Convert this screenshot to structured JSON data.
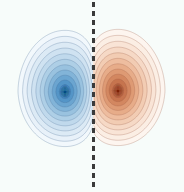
{
  "figure": {
    "width": 184,
    "height": 192,
    "background_color": "#f7fcfa",
    "title": "",
    "border": "none"
  },
  "divider": {
    "name": "nodal-plane-dashed-line",
    "orientation": "vertical",
    "x": 93,
    "y_start": 2,
    "y_end": 190,
    "color": "#3a3a3a",
    "line_width": 3,
    "dash_on": 5,
    "dash_off": 4,
    "style": "dashed"
  },
  "chart_data": {
    "type": "heatmap",
    "subtype": "filled-contour",
    "title": "",
    "subtitle": "",
    "xlabel": "",
    "ylabel": "",
    "xlim": [
      0,
      184
    ],
    "ylim": [
      0,
      192
    ],
    "grid": false,
    "axes_visible": false,
    "tick_labels_x": [],
    "tick_labels_y": [],
    "legend": {
      "visible": false,
      "position": "none",
      "entries": []
    },
    "annotations": [
      {
        "name": "nodal-plane",
        "type": "vertical-dashed-line",
        "x": 93,
        "label": ""
      }
    ],
    "colormap": "RdBu_r",
    "n_levels": 12,
    "levels": [
      -1.0,
      -0.85,
      -0.7,
      -0.57,
      -0.45,
      -0.34,
      -0.25,
      -0.17,
      -0.11,
      -0.06,
      -0.025,
      -0.005,
      0.005,
      0.025,
      0.06,
      0.11,
      0.17,
      0.25,
      0.34,
      0.45,
      0.57,
      0.7,
      0.85,
      1.0
    ],
    "contour_line_color": "#8a7f78",
    "contour_line_width": 0.5,
    "series": [
      {
        "name": "negative-lobe",
        "polarity": "negative",
        "sign": -1,
        "center_x": 65,
        "center_y": 92,
        "peak_value": -1.0,
        "outer_extent": {
          "left": 18,
          "right": 91,
          "top": 38,
          "bottom": 155
        },
        "radius_x": 47,
        "radius_y": 59,
        "flatten_side": "right",
        "fill_colors": [
          "#f2f8fc",
          "#e8f1f9",
          "#dceaf5",
          "#cfe2f1",
          "#c0d9ec",
          "#aecfe6",
          "#99c2df",
          "#82b4d8",
          "#6ba5d0",
          "#5495c7",
          "#3f85be",
          "#2f74b3"
        ],
        "line_color": "#4a6f94"
      },
      {
        "name": "positive-lobe",
        "polarity": "positive",
        "sign": 1,
        "center_x": 118,
        "center_y": 91,
        "peak_value": 1.0,
        "outer_extent": {
          "left": 95,
          "right": 167,
          "top": 38,
          "bottom": 155
        },
        "radius_x": 47,
        "radius_y": 59,
        "flatten_side": "left",
        "fill_colors": [
          "#fdf5ef",
          "#fbeee4",
          "#f9e4d6",
          "#f6d9c6",
          "#f2ccb3",
          "#eebd9f",
          "#e7ac89",
          "#de9a74",
          "#d38760",
          "#c6744e",
          "#b7603e",
          "#a94f33"
        ],
        "line_color": "#9c6049"
      }
    ]
  }
}
